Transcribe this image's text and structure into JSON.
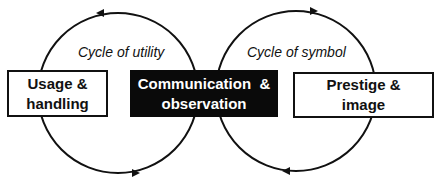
{
  "diagram": {
    "cycles": [
      {
        "id": "utility",
        "label": "Cycle of utility",
        "direction": "counterclockwise"
      },
      {
        "id": "symbol",
        "label": "Cycle of symbol",
        "direction": "clockwise"
      }
    ],
    "nodes": {
      "left": {
        "line1": "Usage &",
        "line2": "handling"
      },
      "center": {
        "line1": "Communication  &",
        "line2": "observation"
      },
      "right": {
        "line1": "Prestige &",
        "line2": "image"
      }
    },
    "colors": {
      "stroke": "#111111",
      "center_fill": "#0a0a0a",
      "center_text": "#ffffff"
    }
  }
}
